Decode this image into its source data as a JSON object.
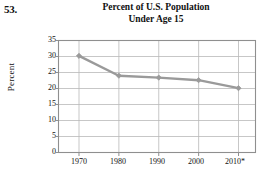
{
  "problem": {
    "number": "53."
  },
  "chart_data": {
    "type": "line",
    "title": "Percent of U.S. Population Under Age 15",
    "title_lines": [
      "Percent of U.S. Population",
      "Under Age 15"
    ],
    "xlabel": "",
    "ylabel": "Percent",
    "categories": [
      "1970",
      "1980",
      "1990",
      "2000",
      "2010*"
    ],
    "x_tick_labels": [
      "1970",
      "1980",
      "1990",
      "2000",
      "2010*"
    ],
    "y_tick_labels": [
      "0",
      "5",
      "10",
      "15",
      "20",
      "25",
      "30",
      "35"
    ],
    "y_ticks": [
      0,
      5,
      10,
      15,
      20,
      25,
      30,
      35
    ],
    "values": [
      30.2,
      24.0,
      23.4,
      22.6,
      20.1
    ],
    "series": [
      {
        "name": "Percent of U.S. Population Under Age 15",
        "values": [
          30.2,
          24.0,
          23.4,
          22.6,
          20.1
        ]
      }
    ],
    "ylim": [
      0,
      35
    ],
    "grid": true,
    "grid_axis": "both",
    "legend": false,
    "legend_position": "none",
    "marker": "diamond",
    "line_color": "#9a9a9a",
    "marker_color": "#9a9a9a",
    "grid_color": "#b9b9b9",
    "axis_color": "#8f8f8f",
    "text_color": "#111111",
    "background_color": "#ffffff"
  }
}
